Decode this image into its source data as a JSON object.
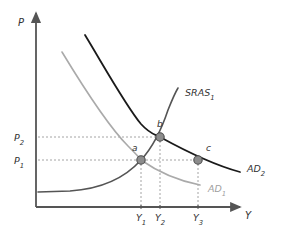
{
  "figure": {
    "type": "economics-ad-as-diagram",
    "axes": {
      "y_label": "P",
      "x_label": "Y",
      "origin": {
        "x": 36,
        "y": 207
      },
      "y_axis_top": {
        "x": 36,
        "y": 13
      },
      "x_axis_right": {
        "x": 240,
        "y": 207
      }
    },
    "price_ticks": [
      {
        "label": "P",
        "sub": "2",
        "y": 137,
        "label_x": 14,
        "label_y": 141
      },
      {
        "label": "P",
        "sub": "1",
        "y": 160,
        "label_x": 14,
        "label_y": 164
      }
    ],
    "output_ticks": [
      {
        "label": "Y",
        "sub": "1",
        "x": 141,
        "label_x": 136,
        "label_y": 221
      },
      {
        "label": "Y",
        "sub": "2",
        "x": 160,
        "label_x": 155,
        "label_y": 221
      },
      {
        "label": "Y",
        "sub": "3",
        "x": 198,
        "label_x": 193,
        "label_y": 221
      }
    ],
    "curves": [
      {
        "name": "SRAS",
        "sub": "1",
        "label_x": 185,
        "label_y": 96,
        "color": "#555555",
        "width": 1.6,
        "path": "M 38 192 L 70 191 C 100 189 124 179 141 160 C 153 147 162 128 168 110 C 172 100 175 93 178 88"
      },
      {
        "name": "AD",
        "sub": "2",
        "label_x": 247,
        "label_y": 172,
        "color": "#1a1a1a",
        "width": 1.8,
        "path": "M 85 35 C 105 68 126 106 141 124 C 150 134 154 134 160 137 C 180 148 210 164 240 172"
      },
      {
        "name": "AD",
        "sub": "1",
        "label_x": 208,
        "label_y": 192,
        "color": "#aaaaaa",
        "width": 1.6,
        "path": "M 62 52 C 82 85 110 128 128 146 C 136 154 139 157 141 160 C 158 172 180 181 200 185"
      }
    ],
    "points": [
      {
        "label": "a",
        "x": 141,
        "y": 160,
        "label_x": 132,
        "label_y": 151
      },
      {
        "label": "b",
        "x": 160,
        "y": 137,
        "label_x": 157,
        "label_y": 127
      },
      {
        "label": "c",
        "x": 198,
        "y": 160,
        "label_x": 206,
        "label_y": 151
      }
    ],
    "guide_lines": [
      {
        "name": "p2-horizontal",
        "x1": 38,
        "y1": 137,
        "x2": 160,
        "y2": 137
      },
      {
        "name": "p1-horizontal",
        "x1": 38,
        "y1": 160,
        "x2": 198,
        "y2": 160
      },
      {
        "name": "y1-vertical",
        "x1": 141,
        "y1": 160,
        "x2": 141,
        "y2": 207
      },
      {
        "name": "y2-vertical",
        "x1": 160,
        "y1": 137,
        "x2": 160,
        "y2": 207
      },
      {
        "name": "y3-vertical",
        "x1": 198,
        "y1": 160,
        "x2": 198,
        "y2": 207
      }
    ],
    "colors": {
      "axis": "#555555",
      "guide": "#9a9a9a",
      "point_fill": "#8c8c8c",
      "point_stroke": "#4a4a4a",
      "text": "#333333",
      "light_text": "#a0a0a0"
    }
  }
}
